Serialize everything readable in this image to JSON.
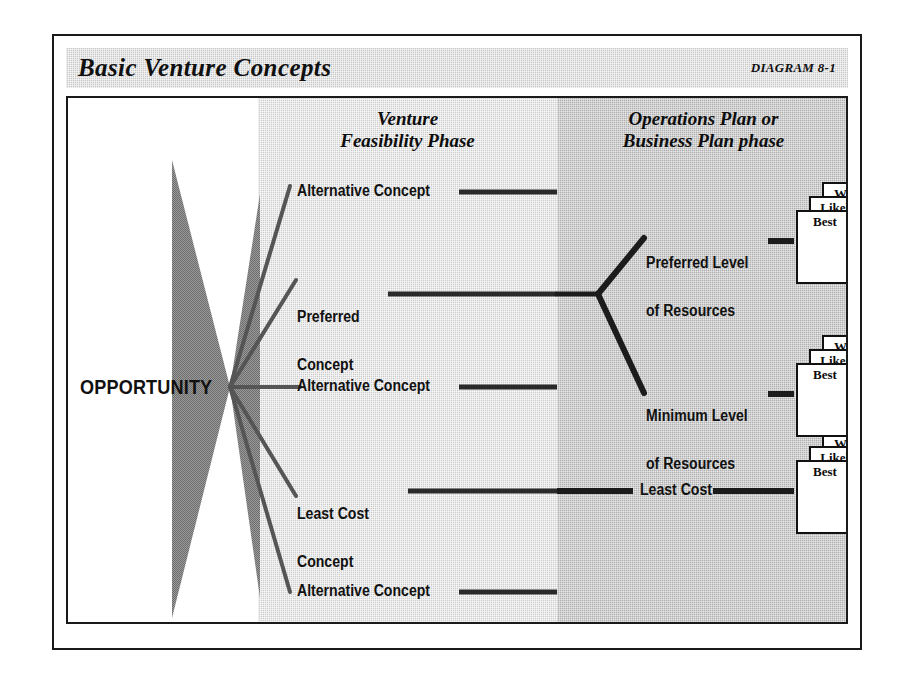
{
  "header": {
    "title": "Basic Venture Concepts",
    "diagram_number": "DIAGRAM 8-1"
  },
  "columns": {
    "opportunity_label": "OPPORTUNITY",
    "feasibility_heading_line1": "Venture",
    "feasibility_heading_line2": "Feasibility Phase",
    "operations_heading_line1": "Operations Plan or",
    "operations_heading_line2": "Business Plan phase"
  },
  "concepts": [
    {
      "id": "alt-1",
      "label_line1": "Alternative Concept",
      "label_line2": ""
    },
    {
      "id": "preferred",
      "label_line1": "Preferred",
      "label_line2": "Concept"
    },
    {
      "id": "alt-2",
      "label_line1": "Alternative Concept",
      "label_line2": ""
    },
    {
      "id": "least-cost",
      "label_line1": "Least Cost",
      "label_line2": "Concept"
    },
    {
      "id": "alt-3",
      "label_line1": "Alternative Concept",
      "label_line2": ""
    }
  ],
  "resources": [
    {
      "id": "preferred-level",
      "label_line1": "Preferred Level",
      "label_line2": "of Resources"
    },
    {
      "id": "minimum-level",
      "label_line1": "Minimum Level",
      "label_line2": "of Resources"
    },
    {
      "id": "least-cost-out",
      "label_line1": "Least Cost",
      "label_line2": ""
    }
  ],
  "scenario_cards": {
    "worst": "Worst",
    "likely": "Likely",
    "best": "Best"
  },
  "colors": {
    "frame": "#1a1a1a",
    "title_bar": "#c9c9c9",
    "feasibility_column": "#cdcdcd",
    "operations_column": "#b0b0b0",
    "connector": "#2a2a2a",
    "bowtie": "#8c8c8c"
  }
}
